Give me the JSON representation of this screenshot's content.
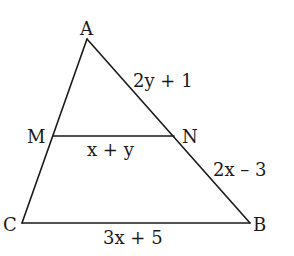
{
  "diagram": {
    "type": "triangle-with-midsegment",
    "vertices": {
      "A": {
        "label": "A",
        "x": 87,
        "y": 39
      },
      "M": {
        "label": "M",
        "x": 53,
        "y": 136
      },
      "N": {
        "label": "N",
        "x": 174,
        "y": 136
      },
      "C": {
        "label": "C",
        "x": 22,
        "y": 223
      },
      "B": {
        "label": "B",
        "x": 250,
        "y": 223
      }
    },
    "segments": {
      "AN": {
        "label": "2y + 1"
      },
      "MN": {
        "label": "x + y"
      },
      "NB": {
        "label": "2x – 3"
      },
      "CB": {
        "label": "3x + 5"
      }
    },
    "edges": [
      "AC",
      "AB",
      "CB",
      "MN"
    ],
    "colors": {
      "stroke": "#1a1a1a",
      "background": "#ffffff"
    }
  }
}
